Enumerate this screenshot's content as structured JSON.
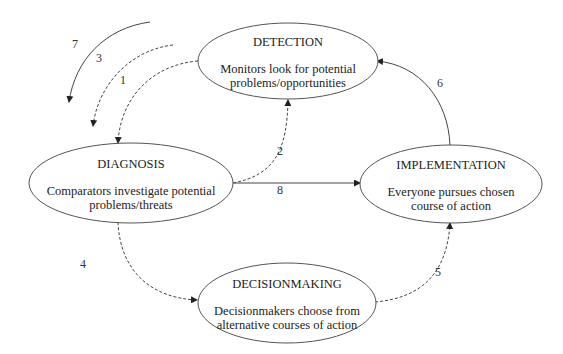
{
  "diagram": {
    "type": "cycle-flow",
    "nodes": [
      {
        "id": "detection",
        "title": "DETECTION",
        "lines": [
          "Monitors look for potential",
          "problems/opportunities"
        ]
      },
      {
        "id": "diagnosis",
        "title": "DIAGNOSIS",
        "lines": [
          "Comparators investigate potential",
          "problems/threats"
        ]
      },
      {
        "id": "implementation",
        "title": "IMPLEMENTATION",
        "lines": [
          "Everyone pursues chosen",
          "course of action"
        ]
      },
      {
        "id": "decisionmaking",
        "title": "DECISIONMAKING",
        "lines": [
          "Decisionmakers choose from",
          "alternative courses of action"
        ]
      }
    ],
    "edges": [
      {
        "label": "1",
        "from": "detection",
        "to": "diagnosis",
        "style": "dashed"
      },
      {
        "label": "2",
        "from": "diagnosis",
        "to": "detection",
        "style": "dashed"
      },
      {
        "label": "3",
        "from": "external",
        "to": "external",
        "style": "dashed"
      },
      {
        "label": "4",
        "from": "diagnosis",
        "to": "decisionmaking",
        "style": "dashed"
      },
      {
        "label": "5",
        "from": "decisionmaking",
        "to": "implementation",
        "style": "dashed"
      },
      {
        "label": "6",
        "from": "implementation",
        "to": "detection",
        "style": "solid"
      },
      {
        "label": "7",
        "from": "external",
        "to": "external",
        "style": "solid"
      },
      {
        "label": "8",
        "from": "diagnosis",
        "to": "implementation",
        "style": "solid"
      }
    ]
  }
}
